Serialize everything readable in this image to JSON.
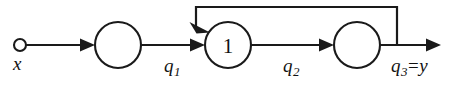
{
  "diagram": {
    "type": "signal-flow-block-diagram",
    "title": "",
    "background_color": "#ffffff",
    "line_color": "#1a1a1a",
    "canvas": {
      "width": 452,
      "height": 86
    },
    "input": {
      "name": "input-terminal",
      "label": "x",
      "shape": "open-circle",
      "cx": 20,
      "cy": 45,
      "r": 6
    },
    "nodes": [
      {
        "id": "node-1",
        "label": "",
        "cx": 118,
        "cy": 45,
        "r": 23
      },
      {
        "id": "node-2",
        "label": "1",
        "cx": 228,
        "cy": 45,
        "r": 23
      },
      {
        "id": "node-3",
        "label": "",
        "cx": 357,
        "cy": 45,
        "r": 23
      }
    ],
    "edges": [
      {
        "id": "edge-input",
        "from": "input-terminal",
        "to": "node-1",
        "label": "",
        "arrow": true
      },
      {
        "id": "edge-q1",
        "from": "node-1",
        "to": "node-2",
        "label": "q1",
        "arrow": true
      },
      {
        "id": "edge-q2",
        "from": "node-2",
        "to": "node-3",
        "label": "q2",
        "arrow": true
      },
      {
        "id": "edge-output",
        "from": "node-3",
        "to": "output",
        "label": "q3=y",
        "arrow": true
      },
      {
        "id": "edge-feedback",
        "from": "node-3-output-tap",
        "to": "node-2",
        "label": "",
        "arrow": true,
        "routing": "top"
      }
    ],
    "labels": {
      "input": {
        "base": "x",
        "sub": "",
        "eq": ""
      },
      "q1": {
        "base": "q",
        "sub": "1",
        "eq": ""
      },
      "q2": {
        "base": "q",
        "sub": "2",
        "eq": ""
      },
      "q3": {
        "base": "q",
        "sub": "3",
        "eq": "=",
        "eq_value": "y"
      }
    },
    "feedback": {
      "tap_x": 397,
      "top_y": 7,
      "left_x": 196,
      "enters_node": "node-2"
    }
  }
}
